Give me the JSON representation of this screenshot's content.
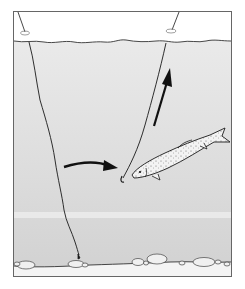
{
  "figure": {
    "colors": {
      "background": "#ffffff",
      "frame": "#555555",
      "air": "#ffffff",
      "water_top": "#e9e9e9",
      "water_bottom": "#d4d4d4",
      "water_band": "#efefef",
      "ink": "#1a1a1a",
      "bed": "#f4f4f4",
      "stone_fill": "#f0f0f0",
      "fish_fill": "#f2f2f2"
    },
    "elements": {
      "left_float": "float-left",
      "right_float": "float-right",
      "left_line": "line-to-bottom",
      "right_line": "line-with-hook",
      "horizontal_arrow": "arrow-right",
      "vertical_arrow": "arrow-up",
      "fish": "trout",
      "riverbed": "pebbles"
    }
  }
}
